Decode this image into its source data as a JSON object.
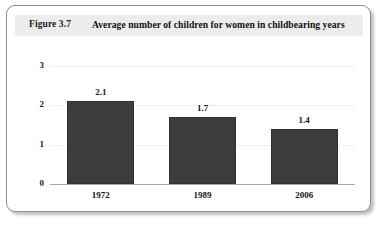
{
  "figure": {
    "number": "Figure 3.7",
    "title": "Average number of children for women in childbearing years"
  },
  "chart_data": {
    "type": "bar",
    "title": "Average number of children for women in childbearing years",
    "categories": [
      "1972",
      "1989",
      "2006"
    ],
    "values": [
      2.1,
      1.7,
      1.4
    ],
    "value_labels": [
      "2.1",
      "1.7",
      "1.4"
    ],
    "xlabel": "",
    "ylabel": "",
    "ylim": [
      0,
      3
    ],
    "yticks": [
      "0",
      "1",
      "2",
      "3"
    ],
    "grid": true,
    "legend": "none",
    "bar_color": "#3c3c3c",
    "gridline_color": "#eceef0",
    "axis_color": "#a8a8a8",
    "header_background": "#ececec"
  }
}
